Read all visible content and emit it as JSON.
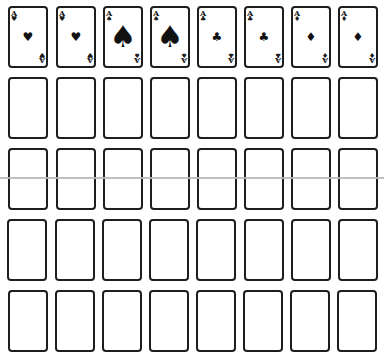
{
  "game": {
    "type": "card-layout",
    "columns": 8,
    "rows": 5
  },
  "foundation": [
    {
      "rank": "A",
      "suit": "heart",
      "glyph": "♥",
      "pip_size": "small"
    },
    {
      "rank": "A",
      "suit": "heart",
      "glyph": "♥",
      "pip_size": "small"
    },
    {
      "rank": "A",
      "suit": "spade",
      "glyph": "♠",
      "pip_size": "large"
    },
    {
      "rank": "A",
      "suit": "spade",
      "glyph": "♠",
      "pip_size": "large"
    },
    {
      "rank": "A",
      "suit": "club",
      "glyph": "♣",
      "pip_size": "small"
    },
    {
      "rank": "A",
      "suit": "club",
      "glyph": "♣",
      "pip_size": "small"
    },
    {
      "rank": "A",
      "suit": "diamond",
      "glyph": "♦",
      "pip_size": "small"
    },
    {
      "rank": "A",
      "suit": "diamond",
      "glyph": "♦",
      "pip_size": "small"
    }
  ],
  "empty_slots_rows": 4,
  "colors": {
    "card_border": "#1e1e1e",
    "suit_ink": "#111111",
    "background": "#ffffff",
    "divider_line": "#b9b9b9"
  }
}
